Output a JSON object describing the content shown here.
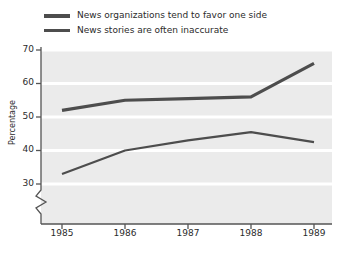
{
  "chart_data": {
    "type": "line",
    "title": "",
    "xlabel": "",
    "ylabel": "Percentage",
    "categories": [
      "1985",
      "1986",
      "1987",
      "1988",
      "1989"
    ],
    "x": [
      1985,
      1986,
      1987,
      1988,
      1989
    ],
    "ylim": [
      30,
      70
    ],
    "xlim": [
      1985,
      1989
    ],
    "yticks": [
      30,
      40,
      50,
      60,
      70
    ],
    "ytick_labels": [
      "30",
      "40",
      "50",
      "60",
      "70"
    ],
    "xtick_labels": [
      "1985",
      "1986",
      "1987",
      "1988",
      "1989"
    ],
    "y_axis_break": true,
    "grid": "horizontal-white",
    "plot_background": "#ebebeb",
    "legend_position": "above-plot-left",
    "series": [
      {
        "name": "News organizations tend to favor one side",
        "values": [
          52,
          55,
          55.5,
          56,
          66
        ],
        "color": "#4d4d4d",
        "linewidth": 3.2
      },
      {
        "name": "News stories are often inaccurate",
        "values": [
          33,
          40,
          43,
          45.5,
          42.5
        ],
        "color": "#4d4d4d",
        "linewidth": 2.2
      }
    ]
  },
  "legend": {
    "items": [
      {
        "label": "News organizations tend to favor one side"
      },
      {
        "label": "News stories are often inaccurate"
      }
    ]
  },
  "axes": {
    "ylabel": "Percentage",
    "yticks": [
      "70",
      "60",
      "50",
      "40",
      "30"
    ],
    "xticks": [
      "1985",
      "1986",
      "1987",
      "1988",
      "1989"
    ]
  },
  "colors": {
    "line": "#4d4d4d",
    "plot_bg": "#ebebeb",
    "gridline": "#ffffff",
    "axis": "#555555",
    "text": "#2b2b2b"
  }
}
